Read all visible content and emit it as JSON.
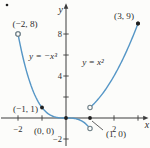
{
  "figure": {
    "artifact_dot": "•"
  },
  "chart_data": {
    "type": "line",
    "curves": [
      {
        "equation_label": "y = −x³",
        "fn": "-x^3",
        "x_min": -2,
        "x_max": 1,
        "start_marker": "open",
        "end_marker": "open",
        "points": [
          [
            -2,
            8
          ],
          [
            -1,
            1
          ],
          [
            0,
            0
          ],
          [
            1,
            -1
          ]
        ]
      },
      {
        "equation_label": "y = x²",
        "fn": "x^2",
        "x_min": 1,
        "x_max": 3,
        "start_marker": "open",
        "end_marker": "filled",
        "points": [
          [
            1,
            1
          ],
          [
            2,
            4
          ],
          [
            3,
            9
          ]
        ]
      }
    ],
    "points": [
      {
        "label": "(−2, 8)",
        "x": -2,
        "y": 8,
        "marker": "open",
        "placement": "above-right"
      },
      {
        "label": "(3, 9)",
        "x": 3,
        "y": 9,
        "marker": "filled",
        "placement": "above-left"
      },
      {
        "label": "(−1, 1)",
        "x": -1,
        "y": 1,
        "marker": "filled",
        "placement": "left"
      },
      {
        "label": "(0, 0)",
        "x": 0,
        "y": 0,
        "marker": "filled",
        "placement": "below-left"
      },
      {
        "label": "(1, 0)",
        "x": 1,
        "y": 0,
        "marker": "filled",
        "placement": "below-right",
        "leader": true
      }
    ],
    "axes": {
      "x_label": "x",
      "y_label": "y",
      "x_ticks": [
        {
          "value": -2,
          "label": "−2"
        },
        {
          "value": -1,
          "label": ""
        },
        {
          "value": 2,
          "label": "2"
        },
        {
          "value": 3,
          "label": ""
        }
      ],
      "y_ticks": [
        {
          "value": 8,
          "label": "8"
        },
        {
          "value": 6,
          "label": ""
        },
        {
          "value": 4,
          "label": "4"
        },
        {
          "value": 2,
          "label": ""
        },
        {
          "value": -2,
          "label": "−2"
        }
      ],
      "xlim": [
        -2.8,
        3.5
      ],
      "ylim": [
        -2.9,
        10.9
      ],
      "grid": false
    },
    "colors": {
      "curve": "#5596c6",
      "axis": "#3c3c3c",
      "text": "#2d2d2d",
      "open_marker_stroke": "#6e7f87",
      "filled_marker": "#1f1f1f",
      "background": "#fcfcfa"
    }
  }
}
